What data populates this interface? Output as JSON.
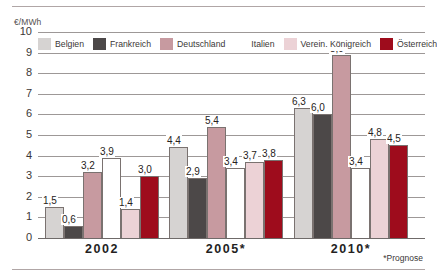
{
  "figure": {
    "unit_label": "€/MWh",
    "footnote": "*Prognose"
  },
  "legend": {
    "items": [
      {
        "label": "Belgien",
        "color": "#d6d3d2"
      },
      {
        "label": "Frankreich",
        "color": "#4c4848"
      },
      {
        "label": "Deutschland",
        "color": "#c79aa0"
      },
      {
        "label": "Italien",
        "color": "#ffffff"
      },
      {
        "label": "Verein. Königreich",
        "color": "#ecd2d6"
      },
      {
        "label": "Österreich",
        "color": "#9e0c1c"
      }
    ]
  },
  "y_axis": {
    "ticks": [
      "10",
      "9",
      "8",
      "7",
      "6",
      "5",
      "4",
      "3",
      "2",
      "1",
      "0"
    ]
  },
  "x_axis": {
    "ticks": [
      "2002",
      "2005*",
      "2010*"
    ]
  },
  "chart_data": {
    "type": "bar",
    "title": "",
    "subtitle": "",
    "xlabel": "",
    "ylabel": "€/MWh",
    "ylim": [
      0,
      10
    ],
    "ytick_step": 1,
    "grid": true,
    "legend_position": "top",
    "annotations": [
      "*Prognose"
    ],
    "categories": [
      "2002",
      "2005*",
      "2010*"
    ],
    "series": [
      {
        "name": "Belgien",
        "color": "#d6d3d2",
        "values": [
          1.5,
          4.4,
          6.3
        ],
        "labels": [
          "1,5",
          "4,4",
          "6,3"
        ]
      },
      {
        "name": "Frankreich",
        "color": "#4c4848",
        "values": [
          0.6,
          2.9,
          6.0
        ],
        "labels": [
          "0,6",
          "2,9",
          "6,0"
        ]
      },
      {
        "name": "Deutschland",
        "color": "#c79aa0",
        "values": [
          3.2,
          5.4,
          8.9
        ],
        "labels": [
          "3,2",
          "5,4",
          "8,9"
        ]
      },
      {
        "name": "Italien",
        "color": "#ffffff",
        "values": [
          3.9,
          3.4,
          3.4
        ],
        "labels": [
          "3,9",
          "3,4",
          "3,4"
        ]
      },
      {
        "name": "Verein. Königreich",
        "color": "#ecd2d6",
        "values": [
          1.4,
          3.7,
          4.8
        ],
        "labels": [
          "1,4",
          "3,7",
          "4,8"
        ]
      },
      {
        "name": "Österreich",
        "color": "#9e0c1c",
        "values": [
          3.0,
          3.8,
          4.5
        ],
        "labels": [
          "3,0",
          "3,8",
          "4,5"
        ]
      }
    ]
  }
}
